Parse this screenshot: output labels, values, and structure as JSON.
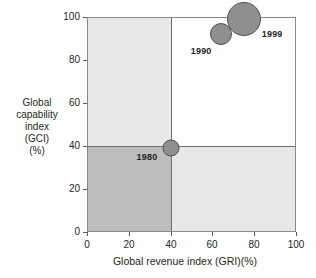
{
  "chart_data": {
    "type": "scatter",
    "title": "",
    "xlabel": "Global revenue index (GRI)(%)",
    "ylabel_lines": [
      "Global",
      "capability",
      "index",
      "(GCI)",
      "(%)"
    ],
    "ylabel": "Global capability index (GCI) (%)",
    "xlim": [
      0,
      100
    ],
    "ylim": [
      0,
      100
    ],
    "xticks": [
      "0",
      "20",
      "40",
      "60",
      "80",
      "100"
    ],
    "yticks": [
      "0",
      "20",
      "40",
      "60",
      "80",
      "100"
    ],
    "xtick_values": [
      0,
      20,
      40,
      60,
      80,
      100
    ],
    "ytick_values": [
      0,
      20,
      40,
      60,
      80,
      100
    ],
    "grid": false,
    "legend": "none",
    "quadrant_dividers": {
      "x": 40,
      "y": 40
    },
    "quadrant_shading": {
      "top_left": "#e8e8e8",
      "top_right": "#ffffff",
      "bottom_left": "#bdbdbd",
      "bottom_right": "#e8e8e8"
    },
    "bubble_color": "#8f8f8f",
    "bubble_border_color": "#4f4f4f",
    "points": [
      {
        "label": "1980",
        "x": 40,
        "y": 39,
        "size": 17
      },
      {
        "label": "1990",
        "x": 64,
        "y": 92,
        "size": 22
      },
      {
        "label": "1999",
        "x": 75,
        "y": 99,
        "size": 34
      }
    ]
  }
}
